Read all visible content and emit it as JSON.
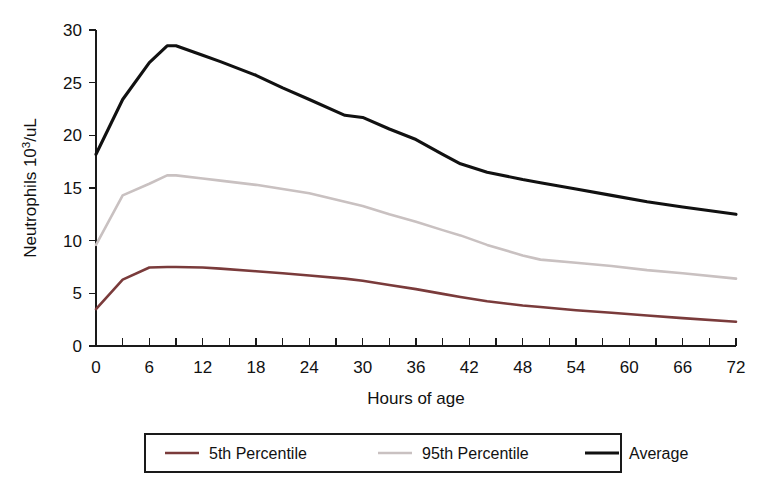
{
  "chart_data": {
    "type": "line",
    "title": "",
    "xlabel": "Hours of age",
    "ylabel": "Neutrophils 10³/uL",
    "ylabel_base": "Neutrophils 10",
    "ylabel_sup": "3",
    "ylabel_tail": "/uL",
    "xlim": [
      0,
      72
    ],
    "ylim": [
      0,
      30
    ],
    "grid": false,
    "legend_position": "bottom-center",
    "x_ticklabels": [
      "0",
      "6",
      "12",
      "18",
      "24",
      "30",
      "36",
      "42",
      "48",
      "54",
      "60",
      "66",
      "72"
    ],
    "x_tickvalues": [
      0,
      6,
      12,
      18,
      24,
      30,
      36,
      42,
      48,
      54,
      60,
      66,
      72
    ],
    "x_minor_tick_interval": 3,
    "y_ticklabels": [
      "0",
      "5",
      "10",
      "15",
      "20",
      "25",
      "30"
    ],
    "y_tickvalues": [
      0,
      5,
      10,
      15,
      20,
      25,
      30
    ],
    "x": [
      0,
      3,
      6,
      8,
      9,
      12,
      14,
      18,
      21,
      24,
      28,
      30,
      33,
      36,
      39,
      41,
      44,
      48,
      50,
      54,
      58,
      62,
      66,
      72
    ],
    "series": [
      {
        "name": "5th Percentile",
        "color": "#7a3b3b",
        "width": 2.6,
        "values": [
          3.5,
          6.3,
          7.45,
          7.5,
          7.5,
          7.45,
          7.35,
          7.1,
          6.9,
          6.7,
          6.4,
          6.2,
          5.8,
          5.4,
          4.95,
          4.65,
          4.25,
          3.85,
          3.7,
          3.4,
          3.15,
          2.9,
          2.65,
          2.3
        ]
      },
      {
        "name": "95th Percentile",
        "color": "#c9c1c1",
        "width": 2.6,
        "values": [
          9.6,
          14.3,
          15.4,
          16.2,
          16.2,
          15.9,
          15.7,
          15.3,
          14.9,
          14.5,
          13.7,
          13.3,
          12.5,
          11.8,
          11.0,
          10.5,
          9.6,
          8.6,
          8.2,
          7.9,
          7.6,
          7.2,
          6.9,
          6.4
        ]
      },
      {
        "name": "Average",
        "color": "#111111",
        "width": 3.1,
        "values": [
          18.2,
          23.4,
          26.9,
          28.5,
          28.5,
          27.6,
          27.0,
          25.7,
          24.5,
          23.4,
          21.9,
          21.7,
          20.6,
          19.6,
          18.2,
          17.3,
          16.5,
          15.8,
          15.5,
          14.9,
          14.3,
          13.7,
          13.2,
          12.5
        ]
      }
    ]
  },
  "legend": {
    "entries": [
      {
        "label": "5th Percentile",
        "color": "#7a3b3b"
      },
      {
        "label": "95th Percentile",
        "color": "#c9c1c1"
      },
      {
        "label": "Average",
        "color": "#111111"
      }
    ]
  }
}
